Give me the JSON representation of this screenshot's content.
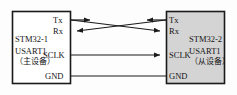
{
  "diagram": {
    "colors": {
      "line": "#1a1a1a",
      "master_fill": "#ffffff",
      "slave_fill": "#d4d4d4",
      "background": "#fdfdfd",
      "text": "#151515"
    },
    "master": {
      "name": "STM32-1",
      "peripheral": "USART1",
      "role": "（主设备）",
      "pins": [
        {
          "id": "tx",
          "label": "Tx"
        },
        {
          "id": "rx",
          "label": "Rx"
        },
        {
          "id": "sclk",
          "label": "SCLK"
        },
        {
          "id": "gnd",
          "label": "GND"
        }
      ]
    },
    "slave": {
      "name": "STM32-2",
      "peripheral": "USART1",
      "role": "（从设备）",
      "pins": [
        {
          "id": "tx",
          "label": "Tx"
        },
        {
          "id": "rx",
          "label": "Rx"
        },
        {
          "id": "sclk",
          "label": "SCLK"
        },
        {
          "id": "gnd",
          "label": "GND"
        }
      ]
    },
    "connections": [
      {
        "id": "tx-to-rx",
        "from": "master.tx",
        "to": "slave.rx",
        "arrows": "both",
        "crossed": true
      },
      {
        "id": "rx-from-tx",
        "from": "slave.tx",
        "to": "master.rx",
        "arrows": "both",
        "crossed": true
      },
      {
        "id": "sclk-link",
        "from": "master.sclk",
        "to": "slave.sclk",
        "arrows": "end",
        "crossed": false
      },
      {
        "id": "gnd-link",
        "from": "master.gnd",
        "to": "slave.gnd",
        "arrows": "none",
        "crossed": false
      }
    ]
  }
}
